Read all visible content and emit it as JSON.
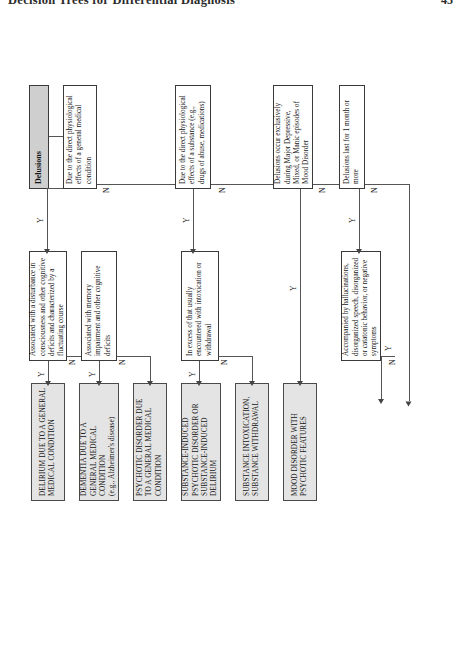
{
  "page": {
    "running_head": "Decision Trees for Differential Diagnosis",
    "page_number": "45"
  },
  "figure": {
    "title": "Delusions",
    "yes_label": "Y",
    "no_label": "N"
  },
  "nodes": {
    "start": "Delusions",
    "c1": "Due to the direct physiological effects of a general medical condition",
    "c1a": "Associated with a disturbance in consciousness and other cognitive deficits and characterized by a fluctuating course",
    "c1b": "Associated with memory impairment and other cognitive deficits",
    "c2": "Due to the direct physiological effects of a substance (e.g., drugs of abuse, medications)",
    "c2a": "In excess of that usually encountered with intoxication or withdrawal",
    "c3": "Delusions occur exclusively during Major Depressive, Mixed, or Manic episodes of Mood Disorder",
    "c4": "Delusions last for 1 month or more",
    "c4a": "Accompanied by hallucinations, disorganized speech, disorganized or catatonic behavior, or negative symptoms"
  },
  "outcomes": {
    "o1": "DELIRIUM DUE TO A GENERAL MEDICAL CONDITION",
    "o2_line1": "DEMENTIA DUE TO A GENERAL MEDICAL CONDITION",
    "o2_line2": "(e.g., Alzheimer's disease)",
    "o3": "PSYCHOTIC DISORDER DUE TO A GENERAL MEDICAL CONDITION",
    "o4": "SUBSTANCE-INDUCED PSYCHOTIC DISORDER or SUBSTANCE-INDUCED DELIRIUM",
    "o5": "SUBSTANCE INTOXICATION, SUBSTANCE WITHDRAWAL",
    "o6": "MOOD DISORDER WITH PSYCHOTIC FEATURES"
  },
  "branch_labels": {
    "b1_y": "Y",
    "b1_n": "N",
    "b1a_y": "Y",
    "b1a_n": "N",
    "b1b_y": "Y",
    "b1b_n": "N",
    "b2_y": "Y",
    "b2_n": "N",
    "b2a_y": "Y",
    "b2a_n": "N",
    "b3_y": "Y",
    "b3_n": "N",
    "b4_y": "Y",
    "b4_n": "N",
    "b4a_y": "Y",
    "b4a_n": "N"
  },
  "colors": {
    "outcome_fill": "#e4e4e4",
    "start_fill": "#cfcfcf",
    "line": "#555555",
    "text": "#141414"
  }
}
